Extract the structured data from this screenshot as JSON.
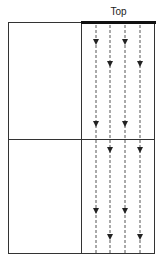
{
  "diagram": {
    "title": "Top",
    "colors": {
      "line": "#333333",
      "top_bar": "#111111",
      "arrow": "#222222"
    },
    "flow_lines": [
      {
        "x": 96,
        "arrows_y": [
          43,
          125,
          212
        ]
      },
      {
        "x": 110,
        "arrows_y": [
          65,
          151,
          238
        ]
      },
      {
        "x": 125,
        "arrows_y": [
          43,
          125,
          212
        ]
      },
      {
        "x": 140,
        "arrows_y": [
          65,
          151,
          238
        ]
      }
    ]
  }
}
